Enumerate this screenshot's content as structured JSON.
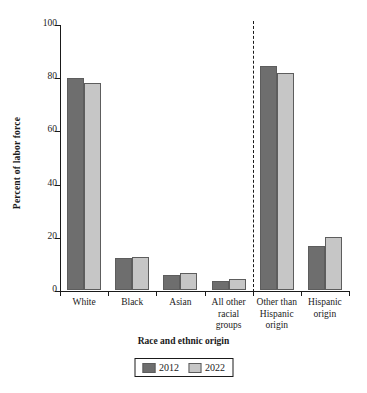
{
  "chart_data": {
    "type": "bar",
    "title": "",
    "xlabel": "Race and ethnic origin",
    "ylabel": "Percent of labor force",
    "categories": [
      "White",
      "Black",
      "Asian",
      "All other racial groups",
      "Other than Hispanic origin",
      "Hispanic origin"
    ],
    "category_lines": [
      [
        "White"
      ],
      [
        "Black"
      ],
      [
        "Asian"
      ],
      [
        "All other",
        "racial",
        "groups"
      ],
      [
        "Other than",
        "Hispanic",
        "origin"
      ],
      [
        "Hispanic",
        "origin"
      ]
    ],
    "series": [
      {
        "name": "2012",
        "color": "#6e6e6e",
        "values": [
          79.8,
          12.0,
          5.6,
          3.3,
          84.3,
          16.5
        ]
      },
      {
        "name": "2022",
        "color": "#c6c6c6",
        "values": [
          77.7,
          12.4,
          6.4,
          4.2,
          81.7,
          20.0
        ]
      }
    ],
    "ylim": [
      0,
      100
    ],
    "yticks": [
      0,
      20,
      40,
      60,
      80,
      100
    ],
    "ytick_labels": [
      "0",
      "20",
      "40",
      "60",
      "80",
      "100"
    ],
    "grid": false,
    "legend_position": "bottom-center",
    "annotations": [
      {
        "type": "vertical-dashed-line",
        "after_category": "All other racial groups"
      }
    ]
  },
  "legend": {
    "items": [
      {
        "label": "2012",
        "color": "#6e6e6e"
      },
      {
        "label": "2022",
        "color": "#c6c6c6"
      }
    ]
  }
}
